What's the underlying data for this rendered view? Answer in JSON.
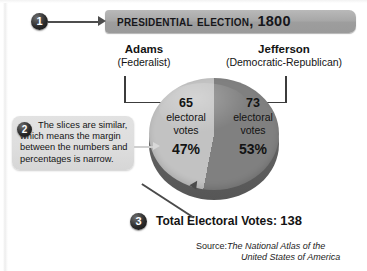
{
  "figure": {
    "title": "Presidential Election, 1800"
  },
  "callouts": [
    {
      "number": "1",
      "target": "title-bar"
    },
    {
      "number": "2",
      "target": "pie-slices",
      "text": "The slices are similar, which means the margin between the numbers and percent­ages is narrow."
    },
    {
      "number": "3",
      "target": "total-electoral-votes"
    }
  ],
  "candidates": [
    {
      "name": "Adams",
      "party": "(Federalist)"
    },
    {
      "name": "Jefferson",
      "party": "(Democratic-Republican)"
    }
  ],
  "slices": [
    {
      "votes": "65",
      "unit_line1": "electoral",
      "unit_line2": "votes",
      "percent": "47%"
    },
    {
      "votes": "73",
      "unit_line1": "electoral",
      "unit_line2": "votes",
      "percent": "53%"
    }
  ],
  "total": {
    "label": "Total Electoral Votes:",
    "value": "138"
  },
  "source": {
    "label": "Source:",
    "title_line1": "The National Atlas of the",
    "title_line2": "United States of America"
  },
  "colors": {
    "title_bar": "#a8a8a8",
    "slice_adams": "#c2c2c2",
    "slice_jefferson": "#808080",
    "pie_depth": "#5f5f5f",
    "callout_box": "#dedede",
    "marker": "#1a1a1a"
  },
  "chart_data": {
    "type": "pie",
    "title": "Presidential Election, 1800",
    "categories": [
      "Adams (Federalist)",
      "Jefferson (Democratic-Republican)"
    ],
    "values": [
      65,
      73
    ],
    "percentages": [
      47,
      53
    ],
    "value_unit": "electoral votes",
    "total": 138,
    "colors": [
      "#c2c2c2",
      "#808080"
    ],
    "legend": "labels-outside",
    "grid": false,
    "source": "The National Atlas of the United States of America"
  }
}
